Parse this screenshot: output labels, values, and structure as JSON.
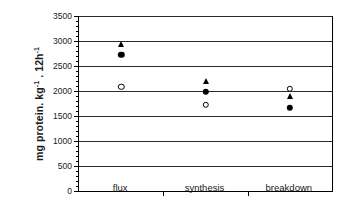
{
  "chart_data": {
    "type": "scatter",
    "title": "",
    "xlabel": "",
    "ylabel": "mg protein. kg-1 . 12h-1",
    "ylabel_parts": {
      "base1": "mg protein. kg",
      "sup1": "-1",
      "base2": " . 12h",
      "sup2": "-1"
    },
    "categories": [
      "flux",
      "synthesis",
      "breakdown"
    ],
    "ylim": [
      0,
      3500
    ],
    "ytick_labels": [
      "0",
      "500",
      "1000",
      "1500",
      "2000",
      "2500",
      "3000",
      "3500"
    ],
    "ytick_values": [
      0,
      500,
      1000,
      1500,
      2000,
      2500,
      3000,
      3500
    ],
    "ytick_minor_step": 100,
    "grid": "horizontal",
    "legend": "none",
    "series": [
      {
        "name": "open-circle",
        "marker": "open-circle",
        "values": [
          2090,
          1720,
          2050
        ]
      },
      {
        "name": "filled-circle",
        "marker": "filled-circle",
        "values": [
          2720,
          1980,
          1660
        ]
      },
      {
        "name": "triangle",
        "marker": "triangle",
        "values": [
          2970,
          2220,
          1920
        ]
      }
    ]
  }
}
